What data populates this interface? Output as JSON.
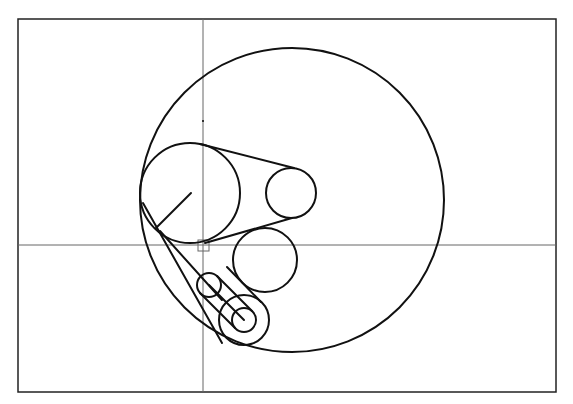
{
  "drawing": {
    "type": "cad-sketch",
    "colors": {
      "stroke": "#111111",
      "crosshair": "#666666",
      "frame": "#222222",
      "background": "#ffffff"
    },
    "frame": {
      "x": 18,
      "y": 19,
      "w": 538,
      "h": 373
    },
    "crosshair": {
      "x": 203,
      "y": 245,
      "pickbox_size": 11
    },
    "origin_marker": {
      "x": 203,
      "y": 121
    },
    "outer_circle": {
      "cx": 292,
      "cy": 200,
      "r": 152
    },
    "large_pulley": {
      "cx": 190,
      "cy": 193,
      "r": 50,
      "radius_line": {
        "x1": 191,
        "y1": 193,
        "x2": 156,
        "y2": 228
      }
    },
    "small_pulley": {
      "cx": 291,
      "cy": 193,
      "r": 25
    },
    "belt_top": {
      "x1": 200,
      "y1": 144,
      "x2": 294,
      "y2": 168
    },
    "belt_bottom": {
      "x1": 200,
      "y1": 242,
      "x2": 292,
      "y2": 218
    },
    "middle_circle": {
      "cx": 265,
      "cy": 260,
      "r": 32
    },
    "link_small_circle": {
      "cx": 209,
      "cy": 285,
      "r": 12
    },
    "link_concentric": {
      "cx": 244,
      "cy": 320,
      "r_outer": 25,
      "r_inner": 12
    },
    "link_lines": [
      {
        "x1": 200,
        "y1": 293,
        "x2": 237,
        "y2": 330
      },
      {
        "x1": 218,
        "y1": 276,
        "x2": 254,
        "y2": 312
      },
      {
        "x1": 209,
        "y1": 285,
        "x2": 244,
        "y2": 320
      },
      {
        "x1": 227,
        "y1": 267,
        "x2": 261,
        "y2": 301
      }
    ],
    "tangent_arc_line": {
      "x1": 143,
      "y1": 203,
      "x2": 222,
      "y2": 340
    }
  }
}
